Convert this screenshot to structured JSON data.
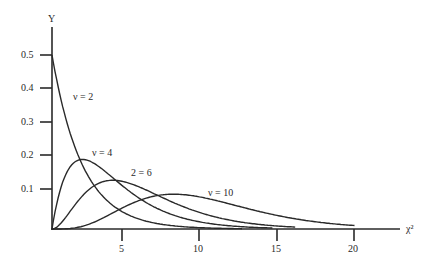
{
  "chart_data": {
    "type": "line",
    "title": "",
    "xlabel": "χ²",
    "ylabel": "Y",
    "xlim": [
      0,
      22
    ],
    "ylim": [
      0,
      0.55
    ],
    "grid": false,
    "legend": "inline curve labels",
    "x_ticks": [
      5,
      10,
      15,
      20
    ],
    "x_tick_labels": [
      "5",
      "10",
      "15",
      "20"
    ],
    "y_ticks": [
      0.1,
      0.2,
      0.3,
      0.4,
      0.5
    ],
    "y_tick_labels": [
      "0.1",
      "0.2",
      "0.3",
      "0.4",
      "0.5"
    ],
    "series": [
      {
        "name": "ν = 2",
        "label": "ν = 2",
        "df": 2,
        "peak": {
          "x": 0,
          "y": 0.5
        }
      },
      {
        "name": "ν = 4",
        "label": "ν = 4",
        "df": 4,
        "peak": {
          "x": 2,
          "y": 0.2
        }
      },
      {
        "name": "ν = 6",
        "label": "2 = 6",
        "df": 6,
        "peak": {
          "x": 4,
          "y": 0.14
        }
      },
      {
        "name": "ν = 10",
        "label": "ν = 10",
        "df": 10,
        "peak": {
          "x": 8,
          "y": 0.1
        }
      }
    ],
    "annotations": [
      "ν = 2",
      "ν = 4",
      "2 = 6",
      "ν = 10"
    ]
  }
}
